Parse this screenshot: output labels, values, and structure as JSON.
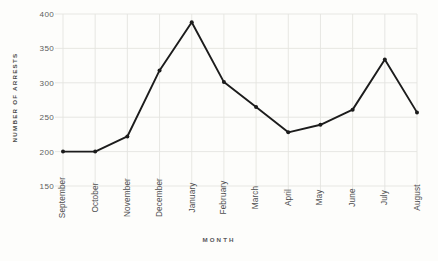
{
  "chart_data": {
    "type": "line",
    "title": "",
    "subtitle": "",
    "xlabel": "MONTH",
    "ylabel": "NUMBER OF ARRESTS",
    "categories": [
      "September",
      "October",
      "November",
      "December",
      "January",
      "February",
      "March",
      "April",
      "May",
      "June",
      "July",
      "August"
    ],
    "values": [
      200,
      200,
      222,
      318,
      388,
      301,
      265,
      228,
      239,
      261,
      334,
      257
    ],
    "series": [
      {
        "name": "Number of arrests",
        "values": [
          200,
          200,
          222,
          318,
          388,
          301,
          265,
          228,
          239,
          261,
          334,
          257
        ]
      }
    ],
    "yticks": [
      150,
      200,
      250,
      300,
      350,
      400
    ],
    "ylim": [
      150,
      400
    ],
    "xlim": [
      0,
      11
    ],
    "grid": true,
    "legend": false,
    "legend_position": "none",
    "annotations": [],
    "marker": "circle",
    "line_color": "#1c1c1c",
    "grid_color": "#e4e4e0",
    "background_color": "#fdfdfb",
    "tick_label_color": "#5d5d5e",
    "axis_title_color": "#4a4a48"
  },
  "axis": {
    "y_title": "NUMBER OF ARRESTS",
    "x_title": "MONTH"
  }
}
